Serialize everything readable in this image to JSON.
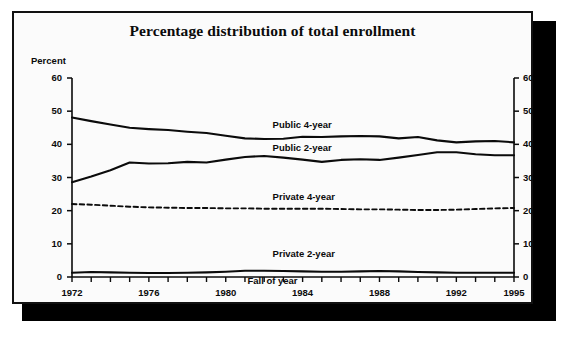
{
  "figure": {
    "title": "Percentage distribution of total enrollment",
    "ylabel": "Percent",
    "xlabel": "Fall of year"
  },
  "axes": {
    "y_ticks_left": [
      "60",
      "50",
      "40",
      "30",
      "20",
      "10",
      "0"
    ],
    "y_ticks_right": [
      "60",
      "50",
      "40",
      "30",
      "20",
      "10",
      "0"
    ],
    "x_ticks": [
      "1972",
      "1976",
      "1980",
      "1984",
      "1988",
      "1992",
      "1995"
    ]
  },
  "series_labels": {
    "public4": "Public 4-year",
    "public2": "Public 2-year",
    "private4": "Private 4-year",
    "private2": "Private 2-year"
  },
  "colors": {
    "ink": "#0b0b0b",
    "paper": "#fbfbfb",
    "shadow": "#000000"
  },
  "chart_data": {
    "type": "line",
    "title": "Percentage distribution of total enrollment",
    "xlabel": "Fall of year",
    "ylabel": "Percent",
    "xlim": [
      1972,
      1995
    ],
    "ylim": [
      0,
      60
    ],
    "ytick_step": 10,
    "xtick_step": 1,
    "xtick_labeled": [
      1972,
      1976,
      1980,
      1984,
      1988,
      1992,
      1995
    ],
    "grid": false,
    "legend": "inline-labels",
    "x": [
      1972,
      1973,
      1974,
      1975,
      1976,
      1977,
      1978,
      1979,
      1980,
      1981,
      1982,
      1983,
      1984,
      1985,
      1986,
      1987,
      1988,
      1989,
      1990,
      1991,
      1992,
      1993,
      1994,
      1995
    ],
    "series": [
      {
        "name": "Public 4-year",
        "style": "solid",
        "values": [
          48.1,
          47.0,
          46.0,
          45.0,
          44.6,
          44.3,
          43.8,
          43.4,
          42.6,
          41.8,
          41.6,
          41.7,
          42.3,
          42.2,
          42.4,
          42.5,
          42.4,
          41.8,
          42.2,
          41.2,
          40.6,
          40.9,
          41.0,
          40.6
        ],
        "label_position": {
          "x": 1984,
          "y": 45.8
        }
      },
      {
        "name": "Public 2-year",
        "style": "solid",
        "values": [
          28.6,
          30.3,
          32.2,
          34.5,
          34.2,
          34.3,
          34.7,
          34.5,
          35.4,
          36.2,
          36.5,
          36.0,
          35.4,
          34.7,
          35.3,
          35.5,
          35.3,
          36.0,
          36.8,
          37.6,
          37.6,
          37.0,
          36.7,
          36.7
        ],
        "label_position": {
          "x": 1984,
          "y": 39.0
        }
      },
      {
        "name": "Private 4-year",
        "style": "dashed",
        "values": [
          22.0,
          21.8,
          21.5,
          21.2,
          21.0,
          20.9,
          20.8,
          20.8,
          20.7,
          20.7,
          20.6,
          20.6,
          20.6,
          20.6,
          20.5,
          20.4,
          20.4,
          20.3,
          20.2,
          20.2,
          20.3,
          20.5,
          20.7,
          20.8
        ],
        "label_position": {
          "x": 1984,
          "y": 24.0
        }
      },
      {
        "name": "Private 2-year",
        "style": "solid",
        "values": [
          1.3,
          1.5,
          1.4,
          1.3,
          1.2,
          1.2,
          1.3,
          1.4,
          1.6,
          1.9,
          1.9,
          1.8,
          1.7,
          1.6,
          1.6,
          1.7,
          1.8,
          1.7,
          1.5,
          1.4,
          1.3,
          1.3,
          1.3,
          1.3
        ],
        "label_position": {
          "x": 1984,
          "y": 6.8
        }
      }
    ]
  }
}
